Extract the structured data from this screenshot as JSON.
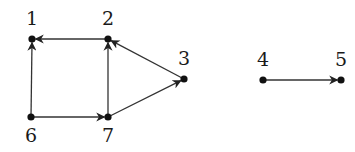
{
  "diagram": {
    "type": "directed-graph",
    "colors": {
      "edge": "#333333",
      "node": "#111111",
      "label": "#1a1a1a",
      "background": "#ffffff"
    },
    "nodes": [
      {
        "id": "1",
        "label": "1",
        "x": 32,
        "y": 39,
        "lx": 32,
        "ly": 25
      },
      {
        "id": "2",
        "label": "2",
        "x": 108,
        "y": 39,
        "lx": 108,
        "ly": 25
      },
      {
        "id": "3",
        "label": "3",
        "x": 184,
        "y": 79,
        "lx": 184,
        "ly": 65
      },
      {
        "id": "4",
        "label": "4",
        "x": 263,
        "y": 80,
        "lx": 263,
        "ly": 66
      },
      {
        "id": "5",
        "label": "5",
        "x": 341,
        "y": 80,
        "lx": 341,
        "ly": 66
      },
      {
        "id": "6",
        "label": "6",
        "x": 31,
        "y": 117,
        "lx": 31,
        "ly": 142
      },
      {
        "id": "7",
        "label": "7",
        "x": 108,
        "y": 117,
        "lx": 108,
        "ly": 142
      }
    ],
    "edges": [
      {
        "from": "2",
        "to": "1"
      },
      {
        "from": "6",
        "to": "1"
      },
      {
        "from": "7",
        "to": "2"
      },
      {
        "from": "3",
        "to": "2"
      },
      {
        "from": "6",
        "to": "7"
      },
      {
        "from": "7",
        "to": "3"
      },
      {
        "from": "4",
        "to": "5"
      }
    ]
  }
}
